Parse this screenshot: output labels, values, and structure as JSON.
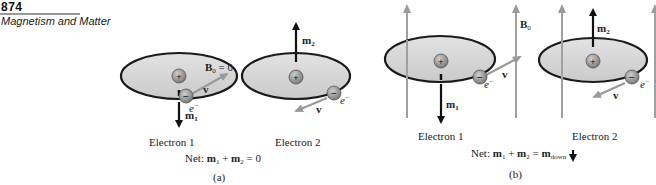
{
  "header": {
    "page_number": "874",
    "chapter_title": "Magnetism and Matter"
  },
  "figure": {
    "panel_a": {
      "label": "(a)",
      "field_label": "B",
      "field_sub": "0",
      "field_eq": " = 0",
      "electron1": {
        "caption": "Electron 1",
        "moment": "m",
        "moment_sub": "1",
        "velocity": "v",
        "charge": "e",
        "charge_sup": "−"
      },
      "electron2": {
        "caption": "Electron 2",
        "moment": "m",
        "moment_sub": "2",
        "velocity": "v",
        "charge": "e",
        "charge_sup": "−"
      },
      "net_prefix": "Net: ",
      "net_m1": "m",
      "net_m1_sub": "1",
      "net_plus": " + ",
      "net_m2": "m",
      "net_m2_sub": "2",
      "net_result": " = 0"
    },
    "panel_b": {
      "label": "(b)",
      "field_label": "B",
      "field_sub": "0",
      "electron1": {
        "caption": "Electron 1",
        "moment": "m",
        "moment_sub": "1",
        "velocity": "v",
        "charge": "e",
        "charge_sup": "−"
      },
      "electron2": {
        "caption": "Electron 2",
        "moment": "m",
        "moment_sub": "2",
        "velocity": "v",
        "charge": "e",
        "charge_sup": "−"
      },
      "net_prefix": "Net: ",
      "net_m1": "m",
      "net_m1_sub": "1",
      "net_plus": " + ",
      "net_m2": "m",
      "net_m2_sub": "2",
      "net_eq": " = ",
      "net_mdown": "m",
      "net_mdown_sub": "down"
    },
    "symbols": {
      "plus": "+",
      "minus": "−"
    },
    "colors": {
      "orbit_fill": "#d4d4d4",
      "orbit_stroke": "#1a1a1a",
      "field_line": "#a0a0a0",
      "moment_arrow": "#111111",
      "charge_ball": "#8c8c8c"
    }
  }
}
